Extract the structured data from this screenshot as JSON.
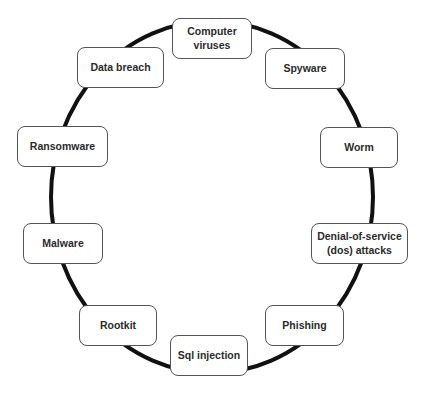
{
  "diagram": {
    "type": "cycle",
    "ring_color": "#111111",
    "nodes": [
      {
        "id": "computer-viruses",
        "label": "Computer viruses",
        "line1": "Computer",
        "line2": "viruses"
      },
      {
        "id": "spyware",
        "label": "Spyware"
      },
      {
        "id": "worm",
        "label": "Worm"
      },
      {
        "id": "denial-of-service",
        "label": "Denial-of-service (dos) attacks",
        "line1": "Denial-of-service",
        "line2": "(dos) attacks"
      },
      {
        "id": "phishing",
        "label": "Phishing"
      },
      {
        "id": "sql-injection",
        "label": "Sql injection"
      },
      {
        "id": "rootkit",
        "label": "Rootkit"
      },
      {
        "id": "malware",
        "label": "Malware"
      },
      {
        "id": "ransomware",
        "label": "Ransomware"
      },
      {
        "id": "data-breach",
        "label": "Data breach"
      }
    ]
  }
}
